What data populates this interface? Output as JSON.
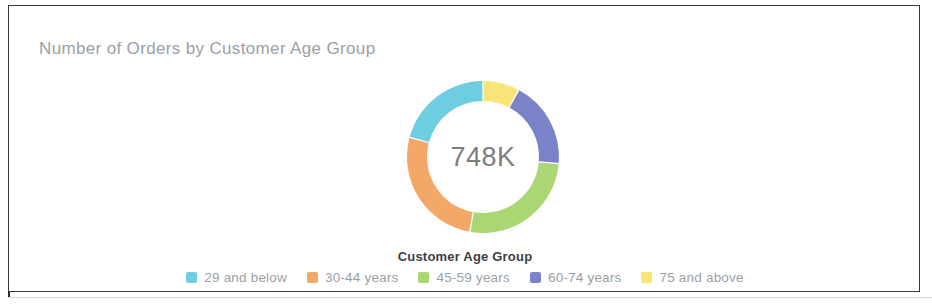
{
  "card": {
    "title": "Number of Orders by Customer Age Group"
  },
  "chart_data": {
    "type": "pie",
    "variant": "donut",
    "title": "Number of Orders by Customer Age Group",
    "center_label": "748K",
    "legend_title": "Customer Age Group",
    "legend_position": "bottom",
    "xlabel": "",
    "ylabel": "",
    "categories": [
      "29 and below",
      "30-44 years",
      "45-59 years",
      "60-74 years",
      "75 and above"
    ],
    "values": [
      20.8,
      26.4,
      26.4,
      18.6,
      7.8
    ],
    "value_unit": "percent",
    "total_label": "748K",
    "colors": [
      "#6ECDE0",
      "#F4A868",
      "#AAD673",
      "#7B83C8",
      "#F9E577"
    ],
    "series": [
      {
        "name": "Number of Orders",
        "values": [
          20.8,
          26.4,
          26.4,
          18.6,
          7.8
        ]
      }
    ],
    "slices": [
      {
        "label": "75 and above",
        "percent": 7.8,
        "color": "#F9E577",
        "start_deg": 0,
        "end_deg": 28
      },
      {
        "label": "60-74 years",
        "percent": 18.6,
        "color": "#7B83C8",
        "start_deg": 28,
        "end_deg": 95
      },
      {
        "label": "45-59 years",
        "percent": 26.4,
        "color": "#AAD673",
        "start_deg": 95,
        "end_deg": 190
      },
      {
        "label": "30-44 years",
        "percent": 26.4,
        "color": "#F4A868",
        "start_deg": 190,
        "end_deg": 285
      },
      {
        "label": "29 and below",
        "percent": 20.8,
        "color": "#6ECDE0",
        "start_deg": 285,
        "end_deg": 360
      }
    ]
  },
  "legend": {
    "title": "Customer Age Group",
    "items": [
      {
        "label": "29 and below",
        "color": "#6ECDE0"
      },
      {
        "label": "30-44 years",
        "color": "#F4A868"
      },
      {
        "label": "45-59 years",
        "color": "#AAD673"
      },
      {
        "label": "60-74 years",
        "color": "#7B83C8"
      },
      {
        "label": "75 and above",
        "color": "#F9E577"
      }
    ]
  }
}
